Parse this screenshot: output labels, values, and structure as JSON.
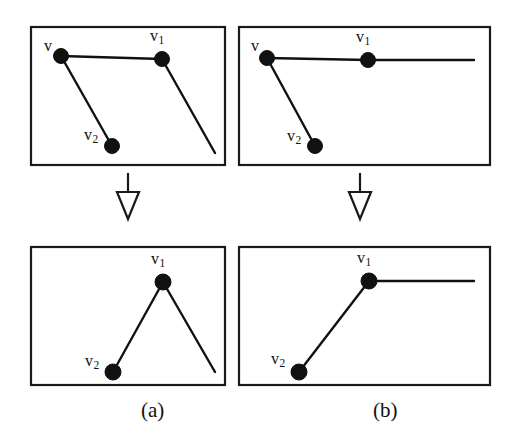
{
  "figure": {
    "width": 518,
    "height": 443,
    "background_color": "#ffffff",
    "ink_color": "#111111",
    "frame_color": "#1a1a1a"
  },
  "labels": {
    "v": "v",
    "v_base": "v",
    "v1_sub": "1",
    "v2_sub": "2"
  },
  "captions": {
    "a": "(a)",
    "b": "(b)"
  },
  "panels": [
    {
      "id": "top-left",
      "name": "panel-top-left-before",
      "frame": {
        "x": 31,
        "y": 27,
        "width": 194,
        "height": 138
      },
      "vertices": [
        {
          "name": "v",
          "label_base": "v",
          "label_sub": "",
          "cx": 61,
          "cy": 56,
          "r": 7.5,
          "label_x": 44,
          "label_y": 38
        },
        {
          "name": "v1",
          "label_base": "v",
          "label_sub": "1",
          "cx": 162,
          "cy": 59,
          "r": 7.5,
          "label_x": 150,
          "label_y": 28
        },
        {
          "name": "v2",
          "label_base": "v",
          "label_sub": "2",
          "cx": 112,
          "cy": 146,
          "r": 7.5,
          "label_x": 84,
          "label_y": 127
        }
      ],
      "edges": [
        {
          "name": "edge-v-to-v1",
          "x1": 61,
          "y1": 56,
          "x2": 162,
          "y2": 59
        },
        {
          "name": "edge-v-to-v2",
          "x1": 61,
          "y1": 56,
          "x2": 112,
          "y2": 146
        },
        {
          "name": "edge-v1-descend",
          "x1": 162,
          "y1": 59,
          "x2": 215,
          "y2": 153
        }
      ]
    },
    {
      "id": "top-right",
      "name": "panel-top-right-before",
      "frame": {
        "x": 239,
        "y": 27,
        "width": 251,
        "height": 138
      },
      "vertices": [
        {
          "name": "v",
          "label_base": "v",
          "label_sub": "",
          "cx": 267,
          "cy": 58,
          "r": 7.5,
          "label_x": 251,
          "label_y": 38
        },
        {
          "name": "v1",
          "label_base": "v",
          "label_sub": "1",
          "cx": 368,
          "cy": 60,
          "r": 7.5,
          "label_x": 356,
          "label_y": 29
        },
        {
          "name": "v2",
          "label_base": "v",
          "label_sub": "2",
          "cx": 315,
          "cy": 146,
          "r": 7.5,
          "label_x": 287,
          "label_y": 128
        }
      ],
      "edges": [
        {
          "name": "edge-v-to-v1",
          "x1": 267,
          "y1": 58,
          "x2": 368,
          "y2": 60
        },
        {
          "name": "edge-v1-horizontal",
          "x1": 368,
          "y1": 60,
          "x2": 474,
          "y2": 60
        },
        {
          "name": "edge-v-to-v2",
          "x1": 267,
          "y1": 58,
          "x2": 315,
          "y2": 146
        }
      ]
    },
    {
      "id": "bottom-left",
      "name": "panel-bottom-left-after",
      "frame": {
        "x": 31,
        "y": 247,
        "width": 194,
        "height": 138
      },
      "vertices": [
        {
          "name": "v1",
          "label_base": "v",
          "label_sub": "1",
          "cx": 163,
          "cy": 282,
          "r": 8.0,
          "label_x": 151,
          "label_y": 251
        },
        {
          "name": "v2",
          "label_base": "v",
          "label_sub": "2",
          "cx": 113,
          "cy": 372,
          "r": 8.0,
          "label_x": 85,
          "label_y": 353
        }
      ],
      "edges": [
        {
          "name": "edge-v2-to-v1",
          "x1": 113,
          "y1": 372,
          "x2": 163,
          "y2": 282
        },
        {
          "name": "edge-v1-descend",
          "x1": 163,
          "y1": 282,
          "x2": 215,
          "y2": 372
        }
      ]
    },
    {
      "id": "bottom-right",
      "name": "panel-bottom-right-after",
      "frame": {
        "x": 239,
        "y": 247,
        "width": 251,
        "height": 138
      },
      "vertices": [
        {
          "name": "v1",
          "label_base": "v",
          "label_sub": "1",
          "cx": 369,
          "cy": 281,
          "r": 8.0,
          "label_x": 357,
          "label_y": 250
        },
        {
          "name": "v2",
          "label_base": "v",
          "label_sub": "2",
          "cx": 299,
          "cy": 372,
          "r": 8.0,
          "label_x": 271,
          "label_y": 351
        }
      ],
      "edges": [
        {
          "name": "edge-v2-to-v1",
          "x1": 299,
          "y1": 372,
          "x2": 369,
          "y2": 281
        },
        {
          "name": "edge-v1-horizontal",
          "x1": 369,
          "y1": 281,
          "x2": 474,
          "y2": 281
        }
      ]
    }
  ],
  "arrows": [
    {
      "name": "transform-arrow-left",
      "stem_x": 128,
      "stem_top": 173,
      "stem_bottom": 192,
      "tip_y": 219,
      "half_width": 11
    },
    {
      "name": "transform-arrow-right",
      "stem_x": 360,
      "stem_top": 173,
      "stem_bottom": 192,
      "tip_y": 219,
      "half_width": 11
    }
  ],
  "caption_positions": {
    "a": {
      "x": 141,
      "y": 400
    },
    "b": {
      "x": 373,
      "y": 400
    }
  }
}
